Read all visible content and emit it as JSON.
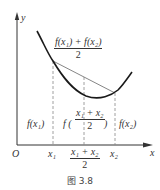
{
  "figure": {
    "caption": "图 3.8",
    "axes": {
      "y_label": "y",
      "x_label": "x",
      "origin_label": "O"
    },
    "x_ticks": {
      "x1": "x₁",
      "mid_num": "x₁ + x₂",
      "mid_den": "2",
      "x2": "x₂"
    },
    "annotations": {
      "chord_mid_num": "f(x₁) + f(x₂)",
      "chord_mid_den": "2",
      "f_x1": "f(x₁)",
      "f_mid_prefix": "f (",
      "f_mid_num": "x₁ + x₂",
      "f_mid_den": "2",
      "f_mid_suffix": ")",
      "f_x2": "f(x₂)"
    },
    "colors": {
      "curve": "#1a1a1a",
      "chord": "#777777",
      "axis": "#333333",
      "dashed": "#888888"
    }
  }
}
